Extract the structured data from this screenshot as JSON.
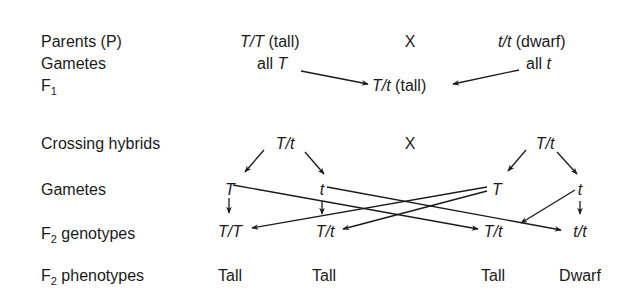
{
  "row_labels": {
    "parents": "Parents (P)",
    "gametes1": "Gametes",
    "f1_main": "F",
    "f1_sub": "1",
    "crossing": "Crossing hybrids",
    "gametes2": "Gametes",
    "f2g_main": "F",
    "f2g_sub": "2",
    "f2g_rest": " genotypes",
    "f2p_main": "F",
    "f2p_sub": "2",
    "f2p_rest": " phenotypes"
  },
  "parents": {
    "left_genotype": "T/T",
    "left_pheno": " (tall)",
    "cross": "X",
    "right_genotype": "t/t",
    "right_pheno": " (dwarf)"
  },
  "gametes1": {
    "left_prefix": "all ",
    "left_allele": "T",
    "right_prefix": "all ",
    "right_allele": "t"
  },
  "f1": {
    "genotype": "T/t",
    "pheno": " (tall)"
  },
  "crossing": {
    "left": "T/t",
    "cross": "X",
    "right": "T/t"
  },
  "gametes2": {
    "a": "T",
    "b": "t",
    "c": "T",
    "d": "t"
  },
  "f2_genotypes": [
    "T/T",
    "T/t",
    "T/t",
    "t/t"
  ],
  "f2_phenotypes": [
    "Tall",
    "Tall",
    "Tall",
    "Dwarf"
  ],
  "colors": {
    "ink": "#1a1a1a",
    "background": "#ffffff"
  }
}
